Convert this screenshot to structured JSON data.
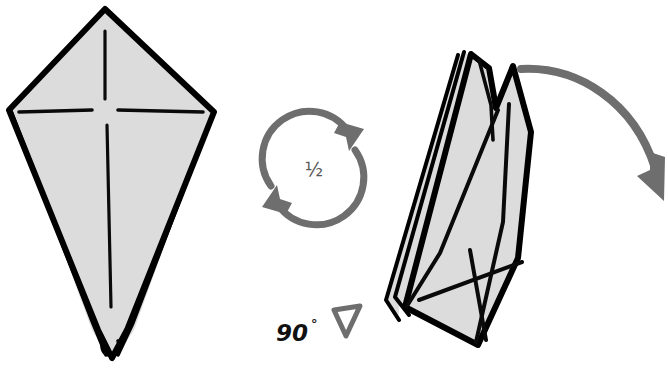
{
  "diagram": {
    "type": "origami-instruction",
    "background_color": "#ffffff",
    "paper_fill_color": "#dcdcdc",
    "paper_outline_color": "#000000",
    "arrow_color": "#6e6e6e",
    "label_color": "#111111"
  },
  "labels": {
    "rotate_half": "½",
    "angle": "90",
    "degree_symbol": "°"
  },
  "figures": [
    {
      "id": "kite-before",
      "name": "kite-base-front-view",
      "position": "left",
      "description": "Kite shaped folded paper with vertical and horizontal crease lines"
    },
    {
      "id": "folded-after",
      "name": "narrow-folded-form-side-view",
      "position": "right",
      "description": "Narrow layered folded form with multiple spiky peaks and crossing creases"
    }
  ],
  "symbols": [
    {
      "id": "rotate-symbol",
      "name": "rotate-half-turn",
      "label": "½",
      "description": "Two circular arrows indicating a half turn rotation"
    },
    {
      "id": "turn-over-symbol",
      "name": "turn-over-90-degrees",
      "label": "90°",
      "description": "Hollow triangle arrowhead with 90 degree rotation label"
    },
    {
      "id": "fold-arrow",
      "name": "curved-fold-arrow",
      "description": "Large gray curved arrow sweeping right and down from the top of the folded form"
    }
  ]
}
